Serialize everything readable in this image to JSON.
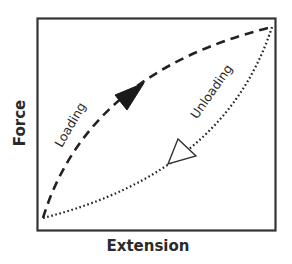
{
  "diagram": {
    "x_axis_label": "Extension",
    "y_axis_label": "Force",
    "colors": {
      "stroke": "#222222",
      "background": "#ffffff",
      "frame": "#333333"
    },
    "curves": [
      {
        "name": "loading",
        "label": "Loading",
        "line_style": "dashed",
        "arrow": "filled",
        "direction": "bottom-left to top-right, bowed upward"
      },
      {
        "name": "unloading",
        "label": "Unloading",
        "line_style": "dotted",
        "arrow": "hollow",
        "direction": "top-right to bottom-left, bowed downward"
      }
    ]
  }
}
